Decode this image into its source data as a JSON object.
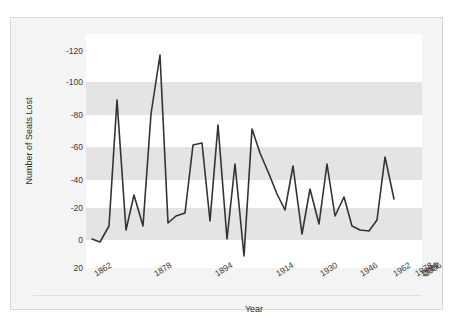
{
  "figure": {
    "top_caption_remnant": "·  ·  ·",
    "background_color": "#f4f4f4",
    "border_color": "#d8d8d8",
    "plot_band_color": "#e4e4e4",
    "plot_alt_band_color": "#ffffff",
    "line_color": "#333333"
  },
  "chart_data": {
    "type": "line",
    "title": "",
    "xlabel": "Year",
    "ylabel": "Number of Seats Lost",
    "grid": true,
    "legend": false,
    "y_axis_inverted": true,
    "ylim": [
      20,
      -128
    ],
    "yticks": [
      -120,
      -100,
      -80,
      -60,
      -40,
      -20,
      0,
      20
    ],
    "ytick_labels": [
      "-120",
      "-100",
      "-80",
      "-60",
      "-40",
      "-20",
      "0",
      "20"
    ],
    "xlim": [
      1862,
      2006
    ],
    "xticks": [
      1862,
      1878,
      1894,
      1914,
      1930,
      1946,
      1962,
      1978,
      1994,
      2002,
      2006
    ],
    "xtick_labels": [
      "1862",
      "1878",
      "1894",
      "1914",
      "1930",
      "1946",
      "1962",
      "1978",
      "1994",
      "2002",
      "2006"
    ],
    "x": [
      1862,
      1866,
      1870,
      1874,
      1878,
      1882,
      1886,
      1890,
      1894,
      1898,
      1902,
      1906,
      1910,
      1914,
      1918,
      1922,
      1926,
      1930,
      1934,
      1938,
      1942,
      1946,
      1950,
      1954,
      1958,
      1962,
      1966,
      1970,
      1974,
      1978,
      1982,
      1986,
      1990,
      1994,
      1998,
      2002,
      2006
    ],
    "values": [
      -3,
      -2,
      -31,
      -96,
      -9,
      -33,
      -12,
      -86,
      -125,
      -19,
      -26,
      -28,
      -57,
      -59,
      -21,
      -75,
      -9,
      -49,
      9,
      -71,
      -55,
      -45,
      -29,
      -18,
      -47,
      -4,
      -34,
      -12,
      -49,
      -15,
      -26,
      -11,
      -9,
      -8,
      -16,
      -52,
      -27
    ],
    "annotations": []
  },
  "chart_geometry": {
    "plot_px": {
      "left": 75,
      "top": 16,
      "width": 336,
      "height": 234
    },
    "y_px_map": [
      {
        "value": -120,
        "y": 17
      },
      {
        "value": -100,
        "y": 48
      },
      {
        "value": -80,
        "y": 81
      },
      {
        "value": -60,
        "y": 113
      },
      {
        "value": -40,
        "y": 146
      },
      {
        "value": -20,
        "y": 174
      },
      {
        "value": 0,
        "y": 206
      },
      {
        "value": 20,
        "y": 234
      }
    ],
    "x_px_map": [
      {
        "value": 1862,
        "x": 6
      },
      {
        "value": 1878,
        "x": 66
      },
      {
        "value": 1894,
        "x": 127
      },
      {
        "value": 1914,
        "x": 188
      },
      {
        "value": 1930,
        "x": 232
      },
      {
        "value": 1946,
        "x": 272
      },
      {
        "value": 1962,
        "x": 305
      },
      {
        "value": 1978,
        "x": 327
      },
      {
        "value": 1994,
        "x": 332
      },
      {
        "value": 2002,
        "x": 334
      },
      {
        "value": 2006,
        "x": 336
      }
    ],
    "series_points_px": [
      [
        6,
        205
      ],
      [
        14,
        208
      ],
      [
        23,
        192
      ],
      [
        31,
        66
      ],
      [
        40,
        196
      ],
      [
        48,
        161
      ],
      [
        57,
        192
      ],
      [
        65,
        80
      ],
      [
        74,
        21
      ],
      [
        82,
        189
      ],
      [
        90,
        182
      ],
      [
        99,
        179
      ],
      [
        107,
        111
      ],
      [
        116,
        109
      ],
      [
        124,
        187
      ],
      [
        132,
        91
      ],
      [
        141,
        205
      ],
      [
        149,
        130
      ],
      [
        158,
        222
      ],
      [
        166,
        95
      ],
      [
        174,
        119
      ],
      [
        183,
        140
      ],
      [
        191,
        160
      ],
      [
        199,
        176
      ],
      [
        207,
        132
      ],
      [
        216,
        200
      ],
      [
        224,
        155
      ],
      [
        233,
        190
      ],
      [
        241,
        130
      ],
      [
        249,
        182
      ],
      [
        258,
        163
      ],
      [
        266,
        192
      ],
      [
        274,
        196
      ],
      [
        283,
        197
      ],
      [
        291,
        186
      ],
      [
        299,
        123
      ],
      [
        308,
        165
      ]
    ]
  }
}
